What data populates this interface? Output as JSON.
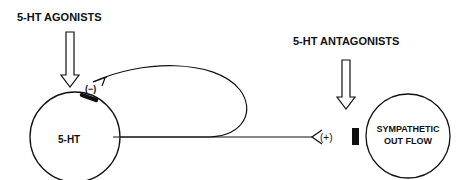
{
  "labels": {
    "agonists": "5-HT AGONISTS",
    "antagonists": "5-HT ANTAGONISTS"
  },
  "nodes": {
    "serotonin": "5-HT",
    "sympathetic_line1": "SYMPATHETIC",
    "sympathetic_line2": "OUT FLOW"
  },
  "signs": {
    "inhibitory": "(−)",
    "excitatory": "(+)"
  },
  "colors": {
    "ink": "#111111",
    "background": "#ffffff"
  }
}
